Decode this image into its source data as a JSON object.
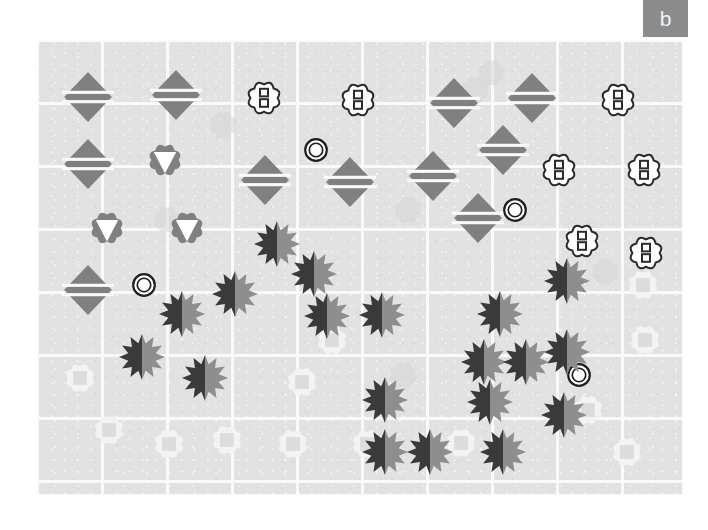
{
  "figure": {
    "panel_label": "b",
    "panel_label_bg": "#8c8c8c",
    "panel_label_color": "#f2f2f2",
    "background": "#ffffff",
    "plot_background": "#e2e2e2",
    "grid_color": "#fafafa",
    "panel": {
      "x": 37,
      "y": 40,
      "width": 646,
      "height": 455
    },
    "grid": {
      "x_lines": [
        0,
        65,
        130,
        195,
        260,
        325,
        390,
        455,
        520,
        585,
        646
      ],
      "y_lines": [
        0,
        63,
        126,
        189,
        252,
        315,
        378,
        441,
        455
      ]
    }
  },
  "legend_glyphs": {
    "striped_diamond": "gray rhombus with two white horizontal stripes",
    "outlined_flower_two_squares": "white cloud/flower outline containing two stacked small squares",
    "gray_flower_white_triangle": "gray cloud/flower containing a white downward triangle",
    "two_tone_starburst": "12-point starburst, dark left half and mid-gray right half",
    "double_ring_circle": "dark concentric double ring, white fill",
    "faint_flower_square": "very faint near-white flower holding a light gray square"
  },
  "colors": {
    "diamond_fill": "#808080",
    "diamond_stripe": "#fafafa",
    "flower_outline": "#2b2b2b",
    "flower_fill": "#ffffff",
    "flower_square_stroke": "#2b2b2b",
    "gray_flower_fill": "#808080",
    "gray_flower_triangle": "#ffffff",
    "star_dark": "#3a3a3a",
    "star_light": "#8e8e8e",
    "ring_stroke": "#1f1f1f",
    "faint_flower_fill": "#f3f3f3",
    "faint_square_fill": "#dcdcdc",
    "ghost_blob_fill": "#d6d6d6"
  },
  "chart_data": {
    "type": "scatter",
    "title": "b",
    "xlabel": "",
    "ylabel": "",
    "xlim": [
      0,
      646
    ],
    "ylim": [
      0,
      455
    ],
    "grid": true,
    "legend": "none",
    "note": "Spatial map of categorical glyph markers on a gridded gray field; coordinates are panel-relative pixels.",
    "series": [
      {
        "name": "striped_diamond",
        "marker": "striped-diamond",
        "color": "#808080",
        "size": 52,
        "points": [
          [
            51,
            57
          ],
          [
            139,
            55
          ],
          [
            417,
            63
          ],
          [
            495,
            58
          ],
          [
            51,
            124
          ],
          [
            466,
            110
          ],
          [
            228,
            140
          ],
          [
            313,
            142
          ],
          [
            396,
            136
          ],
          [
            441,
            178
          ],
          [
            51,
            250
          ]
        ]
      },
      {
        "name": "outlined_flower_two_squares",
        "marker": "flower-two-squares",
        "color": "#ffffff",
        "size": 40,
        "points": [
          [
            227,
            58
          ],
          [
            321,
            60
          ],
          [
            581,
            60
          ],
          [
            522,
            130
          ],
          [
            607,
            130
          ],
          [
            545,
            201
          ],
          [
            609,
            213
          ]
        ]
      },
      {
        "name": "gray_flower_white_triangle",
        "marker": "flower-triangle",
        "color": "#808080",
        "size": 40,
        "points": [
          [
            128,
            120
          ],
          [
            70,
            188
          ],
          [
            150,
            188
          ]
        ]
      },
      {
        "name": "double_ring_circle",
        "marker": "double-ring",
        "color": "#1f1f1f",
        "size": 24,
        "points": [
          [
            279,
            110
          ],
          [
            478,
            170
          ],
          [
            107,
            245
          ],
          [
            542,
            335
          ]
        ]
      },
      {
        "name": "two_tone_starburst",
        "marker": "starburst",
        "color": "#3a3a3a",
        "size": 46,
        "points": [
          [
            240,
            204
          ],
          [
            277,
            234
          ],
          [
            198,
            254
          ],
          [
            530,
            241
          ],
          [
            145,
            274
          ],
          [
            290,
            276
          ],
          [
            463,
            274
          ],
          [
            345,
            275
          ],
          [
            105,
            317
          ],
          [
            168,
            338
          ],
          [
            530,
            312
          ],
          [
            447,
            322
          ],
          [
            489,
            322
          ],
          [
            348,
            360
          ],
          [
            453,
            362
          ],
          [
            527,
            375
          ],
          [
            348,
            412
          ],
          [
            393,
            412
          ],
          [
            466,
            412
          ]
        ]
      },
      {
        "name": "faint_flower_square",
        "marker": "faint-flower-square",
        "color": "#f3f3f3",
        "size": 36,
        "points": [
          [
            43,
            338
          ],
          [
            295,
            300
          ],
          [
            606,
            245
          ],
          [
            72,
            390
          ],
          [
            190,
            400
          ],
          [
            265,
            342
          ],
          [
            132,
            404
          ],
          [
            256,
            404
          ],
          [
            330,
            404
          ],
          [
            424,
            403
          ],
          [
            551,
            370
          ],
          [
            590,
            412
          ],
          [
            608,
            300
          ]
        ]
      },
      {
        "name": "ghost_blob",
        "marker": "ghost-blob",
        "color": "#d6d6d6",
        "size": 34,
        "points": [
          [
            186,
            85
          ],
          [
            438,
            50
          ],
          [
            130,
            180
          ],
          [
            371,
            170
          ],
          [
            454,
            33
          ],
          [
            568,
            232
          ],
          [
            366,
            335
          ]
        ]
      }
    ]
  }
}
